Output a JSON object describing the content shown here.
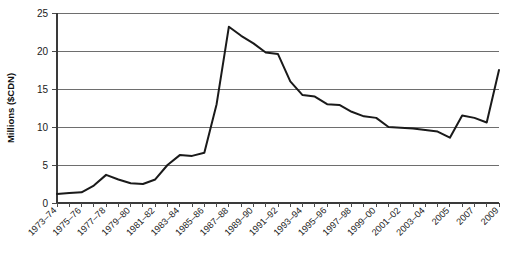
{
  "chart_data": {
    "type": "line",
    "title": "",
    "xlabel": "",
    "ylabel": "Millions ($CDN)",
    "ylim": [
      0,
      25
    ],
    "yticks": [
      0,
      5,
      10,
      15,
      20,
      25
    ],
    "ytick_labels": [
      "0",
      "5",
      "10",
      "15",
      "20",
      "25"
    ],
    "grid": true,
    "legend": "none",
    "categories": [
      "1973–74",
      "1974–75",
      "1975–76",
      "1976–77",
      "1977–78",
      "1978–79",
      "1979–80",
      "1980–81",
      "1981–82",
      "1982–83",
      "1983–84",
      "1984–85",
      "1985–86",
      "1986–87",
      "1987–88",
      "1988–89",
      "1989–90",
      "1990–91",
      "1991–92",
      "1992–93",
      "1993–94",
      "1994–95",
      "1995–96",
      "1996–97",
      "1997–98",
      "1998–99",
      "1999–00",
      "2000–01",
      "2001–02",
      "2002–03",
      "2003–04",
      "2004",
      "2005",
      "2006",
      "2007",
      "2008",
      "2009"
    ],
    "xtick_labels": [
      "1973–74",
      "1975–76",
      "1977–78",
      "1979–80",
      "1981–82",
      "1983–84",
      "1985–86",
      "1987–88",
      "1989–90",
      "1991–92",
      "1993–94",
      "1995–96",
      "1997–98",
      "1999–00",
      "2001–02",
      "2003–04",
      "2005",
      "2007",
      "2009"
    ],
    "values": [
      1.2,
      1.3,
      1.4,
      2.3,
      3.7,
      3.1,
      2.6,
      2.5,
      3.1,
      5.0,
      6.3,
      6.2,
      6.6,
      13.0,
      23.2,
      22.0,
      21.0,
      19.8,
      19.6,
      16.0,
      14.2,
      14.0,
      13.0,
      12.9,
      12.0,
      11.4,
      11.2,
      10.0,
      9.9,
      9.8,
      9.6,
      9.4,
      8.6,
      11.5,
      11.2,
      10.6,
      17.5
    ]
  }
}
